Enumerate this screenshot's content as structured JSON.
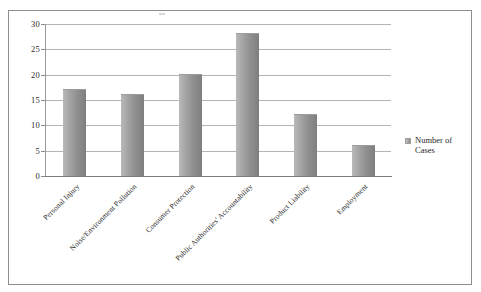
{
  "chart_data": {
    "type": "bar",
    "title": "",
    "xlabel": "",
    "ylabel": "",
    "categories": [
      "Personal Injury",
      "Noise/Environment Pollution",
      "Consumer Protection",
      "Public Authorities' Accountability",
      "Product Liability",
      "Employment"
    ],
    "series": [
      {
        "name": "Number of Cases",
        "values": [
          17,
          16,
          20,
          28,
          12,
          6
        ]
      }
    ],
    "values": [
      17,
      16,
      20,
      28,
      12,
      6
    ],
    "ylim": [
      0,
      30
    ],
    "ytick_labels": [
      "0",
      "5",
      "10",
      "15",
      "20",
      "25",
      "30"
    ],
    "ytick_values": [
      0,
      5,
      10,
      15,
      20,
      25,
      30
    ],
    "grid": true,
    "legend": {
      "position": "right",
      "entries": [
        {
          "label": "Number of Cases",
          "color": "#8f8f8f"
        }
      ]
    },
    "colors": {
      "bar_light": "#b9b9b9",
      "bar_dark": "#7e7e7e",
      "gridline": "#b4b4b4",
      "axis": "#8a8a8a",
      "frame": "#8d8d8d",
      "text": "#2b2b2b",
      "background": "#ffffff"
    }
  }
}
